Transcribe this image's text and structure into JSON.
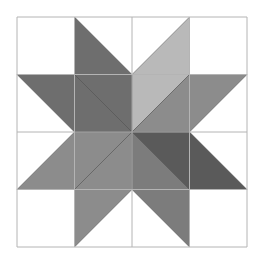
{
  "figure": {
    "type": "quilt-block",
    "name": "eight-point star",
    "grid": {
      "rows": 4,
      "cols": 4,
      "origin": [
        17,
        17
      ],
      "cell": 57.5,
      "line_color": "#b4b4b4",
      "seam_color": "#3c3c3c"
    },
    "colors": {
      "dark": "#6e6e6e",
      "darker": "#5a5a5a",
      "medium": "#8c8c8c",
      "medium2": "#7c7c7c",
      "light": "#b9b9b9",
      "background": "#ffffff"
    },
    "pieces": [
      {
        "row": 0,
        "col": 1,
        "corners": [
          "TL",
          "BL",
          "BR"
        ],
        "color": "dark"
      },
      {
        "row": 0,
        "col": 2,
        "corners": [
          "BL",
          "TR",
          "BR"
        ],
        "color": "light"
      },
      {
        "row": 1,
        "col": 0,
        "corners": [
          "TL",
          "TR",
          "BR"
        ],
        "color": "dark"
      },
      {
        "row": 1,
        "col": 1,
        "corners": [
          "TL",
          "TR",
          "BR"
        ],
        "color": "dark"
      },
      {
        "row": 1,
        "col": 1,
        "corners": [
          "TL",
          "BL",
          "BR"
        ],
        "color": "dark"
      },
      {
        "row": 1,
        "col": 2,
        "corners": [
          "TL",
          "TR",
          "BL"
        ],
        "color": "light"
      },
      {
        "row": 1,
        "col": 2,
        "corners": [
          "TR",
          "BR",
          "BL"
        ],
        "color": "medium"
      },
      {
        "row": 1,
        "col": 3,
        "corners": [
          "TL",
          "TR",
          "BL"
        ],
        "color": "medium"
      },
      {
        "row": 2,
        "col": 0,
        "corners": [
          "TR",
          "BL",
          "BR"
        ],
        "color": "medium"
      },
      {
        "row": 2,
        "col": 1,
        "corners": [
          "TL",
          "TR",
          "BL"
        ],
        "color": "medium"
      },
      {
        "row": 2,
        "col": 1,
        "corners": [
          "TR",
          "BR",
          "BL"
        ],
        "color": "medium"
      },
      {
        "row": 2,
        "col": 2,
        "corners": [
          "TL",
          "TR",
          "BR"
        ],
        "color": "darker"
      },
      {
        "row": 2,
        "col": 2,
        "corners": [
          "TL",
          "BL",
          "BR"
        ],
        "color": "medium2"
      },
      {
        "row": 2,
        "col": 3,
        "corners": [
          "TL",
          "BL",
          "BR"
        ],
        "color": "darker"
      },
      {
        "row": 3,
        "col": 1,
        "corners": [
          "TL",
          "TR",
          "BL"
        ],
        "color": "medium"
      },
      {
        "row": 3,
        "col": 2,
        "corners": [
          "TL",
          "TR",
          "BR"
        ],
        "color": "medium2"
      }
    ]
  }
}
